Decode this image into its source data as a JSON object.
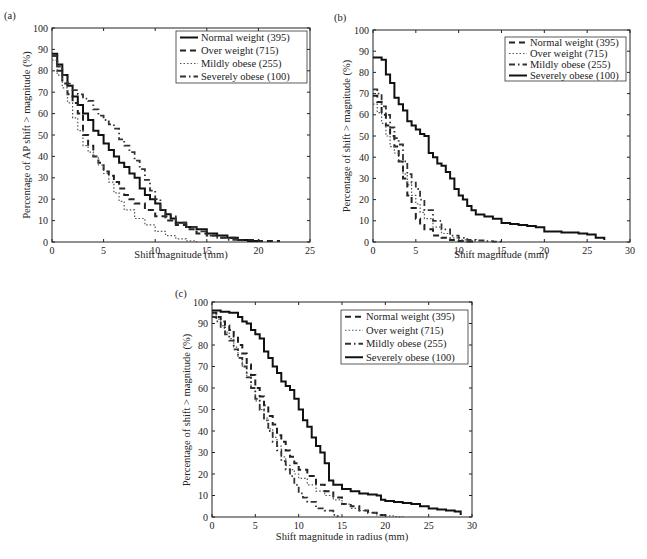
{
  "chart_data": [
    {
      "id": "a",
      "panel_label": "(a)",
      "type": "line",
      "xlabel": "Shift magnitude (mm)",
      "ylabel": "Percentage of AP shift > magnitude (%)",
      "xlim": [
        0,
        25
      ],
      "ylim": [
        0,
        100
      ],
      "xticks": [
        0,
        5,
        10,
        15,
        20,
        25
      ],
      "yticks": [
        0,
        10,
        20,
        30,
        40,
        50,
        60,
        70,
        80,
        90,
        100
      ],
      "grid": false,
      "legend_position": "upper right",
      "box": {
        "x0": 52,
        "x1": 310,
        "y0": 28,
        "y1": 242
      },
      "legend_box": {
        "x": 176,
        "y": 31,
        "w": 131,
        "h": 52
      },
      "series": [
        {
          "name": "Normal weight (395)",
          "style": "solid",
          "x": [
            0,
            0.5,
            1,
            1.5,
            2,
            2.5,
            3,
            3.5,
            4,
            4.5,
            5,
            5.5,
            6,
            6.5,
            7,
            7.5,
            8,
            8.5,
            9,
            9.5,
            10,
            10.5,
            11,
            11.5,
            12,
            13,
            14,
            15,
            16,
            17,
            18,
            19,
            20
          ],
          "y": [
            88,
            83,
            78,
            73,
            68,
            64,
            60,
            57,
            52,
            50,
            46,
            43,
            40,
            37,
            35,
            32,
            30,
            25,
            22,
            20,
            18,
            15,
            13,
            11,
            9,
            7,
            6,
            4,
            3,
            2,
            1,
            0.5,
            0
          ]
        },
        {
          "name": "Over weight (715)",
          "style": "dashed",
          "x": [
            0,
            0.5,
            1,
            1.5,
            2,
            2.5,
            3,
            3.5,
            4,
            4.5,
            5,
            5.5,
            6,
            6.5,
            7,
            7.5,
            8,
            9,
            10,
            11,
            12,
            13,
            14,
            15,
            16,
            18,
            20,
            22
          ],
          "y": [
            87,
            80,
            74,
            69,
            65,
            60,
            50,
            45,
            40,
            37,
            33,
            31,
            28,
            25,
            22,
            20,
            18,
            15,
            12,
            10,
            8,
            6,
            4,
            3,
            2,
            1,
            0.5,
            0
          ]
        },
        {
          "name": "Mildly obese (255)",
          "style": "dotted",
          "x": [
            0,
            0.5,
            1,
            1.5,
            2,
            2.5,
            3,
            3.5,
            4,
            4.5,
            5,
            5.5,
            6,
            6.5,
            7,
            8,
            9,
            10,
            11,
            12,
            13,
            14
          ],
          "y": [
            85,
            78,
            72,
            65,
            58,
            52,
            45,
            42,
            40,
            36,
            32,
            28,
            23,
            19,
            15,
            11,
            8,
            5,
            3,
            1.5,
            0.5,
            0
          ]
        },
        {
          "name": "Severely obese (100)",
          "style": "dashdot",
          "x": [
            0,
            0.5,
            1,
            1.5,
            2,
            2.5,
            3,
            3.5,
            4,
            4.5,
            5,
            5.5,
            6,
            6.5,
            7,
            7.5,
            8,
            8.5,
            9,
            9.5,
            10,
            10.5,
            11,
            12,
            13,
            14,
            15,
            16,
            17,
            18
          ],
          "y": [
            87,
            82,
            78,
            74,
            71,
            69,
            67,
            66,
            62,
            59,
            57,
            55,
            53,
            48,
            45,
            42,
            38,
            34,
            29,
            24,
            20,
            15,
            12,
            9,
            7,
            5,
            3,
            2,
            1,
            0
          ]
        }
      ]
    },
    {
      "id": "b",
      "panel_label": "(b)",
      "type": "line",
      "xlabel": "Shift magnitude (mm)",
      "ylabel": "Percentage of shift > magnitude (%)",
      "xlim": [
        0,
        30
      ],
      "ylim": [
        0,
        100
      ],
      "xticks": [
        0,
        5,
        10,
        15,
        20,
        25,
        30
      ],
      "yticks": [
        0,
        10,
        20,
        30,
        40,
        50,
        60,
        70,
        80,
        90,
        100
      ],
      "grid": false,
      "legend_position": "upper right",
      "box": {
        "x0": 373,
        "x1": 630,
        "y0": 30,
        "y1": 242
      },
      "legend_box": {
        "x": 505,
        "y": 37,
        "w": 121,
        "h": 44
      },
      "series": [
        {
          "name": "Normal weight (395)",
          "style": "dashed",
          "x": [
            0,
            0.5,
            1,
            1.5,
            2,
            2.5,
            3,
            3.5,
            4,
            4.5,
            5,
            5.5,
            6,
            7,
            8,
            9,
            10,
            11,
            12
          ],
          "y": [
            69,
            66,
            60,
            55,
            50,
            45,
            38,
            30,
            22,
            16,
            11,
            8,
            6,
            3,
            2,
            1,
            0.5,
            0.2,
            0
          ]
        },
        {
          "name": "Over weight (715)",
          "style": "dotted",
          "x": [
            0,
            0.5,
            1,
            1.5,
            2,
            2.5,
            3,
            3.5,
            4,
            4.5,
            5,
            5.5,
            6,
            7,
            8,
            9,
            10,
            11,
            12
          ],
          "y": [
            65,
            61,
            56,
            50,
            45,
            42,
            38,
            32,
            27,
            22,
            18,
            14,
            11,
            7,
            4,
            2,
            1,
            0.5,
            0
          ]
        },
        {
          "name": "Mildly obese (255)",
          "style": "dashdot",
          "x": [
            0,
            0.5,
            1,
            1.5,
            2,
            2.5,
            3,
            3.5,
            4,
            4.5,
            5,
            5.5,
            6,
            7,
            8,
            9,
            10,
            11,
            12,
            13,
            14,
            15
          ],
          "y": [
            72,
            70,
            64,
            60,
            54,
            49,
            46,
            38,
            32,
            28,
            25,
            20,
            15,
            10,
            6,
            3,
            2,
            1,
            0.7,
            0.4,
            0.2,
            0
          ]
        },
        {
          "name": "Severely obese (100)",
          "style": "solid",
          "x": [
            0,
            1,
            1.5,
            2,
            2.5,
            3,
            3.5,
            4,
            4.5,
            5,
            5.5,
            6,
            6.5,
            7,
            7.5,
            8,
            8.5,
            9,
            9.5,
            10,
            10.5,
            11,
            11.5,
            12,
            13,
            14,
            15,
            16,
            17,
            18,
            19,
            20,
            22,
            24,
            25,
            26,
            27
          ],
          "y": [
            87,
            86,
            79,
            75,
            68,
            65,
            62,
            57,
            55,
            53,
            51,
            50,
            42,
            40,
            37,
            36,
            33,
            30,
            25,
            22,
            20,
            17,
            15,
            13,
            12,
            11,
            9,
            8.5,
            8,
            7.5,
            7,
            5,
            4.5,
            4,
            3.5,
            2,
            1
          ]
        }
      ]
    },
    {
      "id": "c",
      "panel_label": "(c)",
      "type": "line",
      "xlabel": "Shift magnitude in radius (mm)",
      "ylabel": "Percentage of shift > magnitude (%)",
      "xlim": [
        0,
        30
      ],
      "ylim": [
        0,
        100
      ],
      "xticks": [
        0,
        5,
        10,
        15,
        20,
        25,
        30
      ],
      "yticks": [
        0,
        10,
        20,
        30,
        40,
        50,
        60,
        70,
        80,
        90,
        100
      ],
      "grid": false,
      "legend_position": "upper right",
      "box": {
        "x0": 212,
        "x1": 472,
        "y0": 302,
        "y1": 517
      },
      "legend_box": {
        "x": 341,
        "y": 310,
        "w": 127,
        "h": 54
      },
      "series": [
        {
          "name": "Normal weight (395)",
          "style": "dashed",
          "x": [
            0,
            0.5,
            1,
            1.5,
            2,
            2.5,
            3,
            3.5,
            4,
            4.5,
            5,
            5.5,
            6,
            6.5,
            7,
            7.5,
            8,
            8.5,
            9,
            9.5,
            10,
            11,
            12,
            13,
            14,
            15,
            16,
            17,
            18,
            19,
            20
          ],
          "y": [
            95,
            93,
            91,
            89,
            87,
            84,
            80,
            76,
            71,
            66,
            60,
            56,
            52,
            47,
            43,
            38,
            35,
            31,
            28,
            25,
            22,
            19,
            15,
            12,
            9,
            6,
            5,
            3,
            2,
            1,
            0
          ]
        },
        {
          "name": "Over weight (715)",
          "style": "dotted",
          "x": [
            0,
            0.5,
            1,
            1.5,
            2,
            2.5,
            3,
            3.5,
            4,
            4.5,
            5,
            5.5,
            6,
            6.5,
            7,
            7.5,
            8,
            8.5,
            9,
            9.5,
            10,
            11,
            12,
            13,
            14,
            15,
            16,
            17,
            18,
            19,
            20,
            21,
            22
          ],
          "y": [
            94,
            92,
            89,
            86,
            83,
            79,
            74,
            70,
            65,
            60,
            54,
            50,
            46,
            41,
            37,
            33,
            28,
            24,
            22,
            20,
            18,
            15,
            12,
            10,
            8,
            6,
            4,
            3,
            2,
            1,
            0.5,
            0.2,
            0
          ]
        },
        {
          "name": "Mildly obese (255)",
          "style": "dashdot",
          "x": [
            0,
            0.5,
            1,
            1.5,
            2,
            2.5,
            3,
            3.5,
            4,
            4.5,
            5,
            5.5,
            6,
            6.5,
            7,
            7.5,
            8,
            8.5,
            9,
            9.5,
            10,
            10.5,
            11,
            12,
            13,
            14,
            14.5
          ],
          "y": [
            93,
            91,
            88,
            85,
            82,
            78,
            74,
            70,
            65,
            60,
            55,
            50,
            45,
            40,
            35,
            31,
            26,
            22,
            19,
            15,
            11,
            9,
            7,
            4,
            3,
            1,
            0
          ]
        },
        {
          "name": "Severely obese (100)",
          "style": "solid",
          "x": [
            0,
            1,
            2,
            3,
            3.5,
            4,
            4.5,
            5,
            5.5,
            6,
            6.5,
            7,
            7.5,
            8,
            8.5,
            9,
            9.5,
            10,
            10.5,
            11,
            11.5,
            12,
            12.5,
            13,
            13.5,
            14,
            15,
            16,
            17,
            18,
            19,
            19.5,
            20,
            21,
            22,
            23,
            24,
            25,
            26,
            27,
            28,
            28.7
          ],
          "y": [
            96,
            95.5,
            95,
            93,
            91,
            90,
            87,
            85,
            83,
            77,
            74,
            70,
            67,
            63,
            61,
            59,
            55,
            50,
            45,
            42,
            37,
            33,
            30,
            25,
            17,
            15,
            13,
            12,
            11,
            10.5,
            10,
            8,
            7.5,
            7,
            6.5,
            6,
            5,
            4,
            3.5,
            3,
            2.5,
            1
          ]
        }
      ]
    }
  ]
}
